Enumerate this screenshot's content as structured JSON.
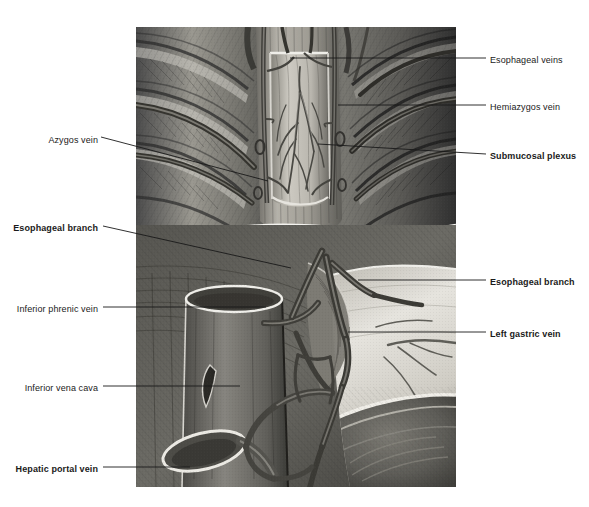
{
  "figure": {
    "kind": "anatomical-illustration",
    "style": "grayscale pencil / wash medical illustration",
    "frame": {
      "x": 136,
      "y": 27,
      "width": 320,
      "height": 460
    }
  },
  "labels": {
    "left": [
      {
        "id": "azygos-vein",
        "text": "Azygos vein",
        "bold": false,
        "text_x": 98,
        "text_y": 141,
        "leader": {
          "x1": 101,
          "y1": 137,
          "x2": 268,
          "y2": 181
        }
      },
      {
        "id": "esophageal-branch-left",
        "text": "Esophageal branch",
        "bold": true,
        "text_x": 98,
        "text_y": 229,
        "leader": {
          "x1": 103,
          "y1": 226,
          "x2": 291,
          "y2": 268
        }
      },
      {
        "id": "inferior-phrenic-vein",
        "text": "Inferior phrenic vein",
        "bold": false,
        "text_x": 98,
        "text_y": 310,
        "leader": {
          "x1": 103,
          "y1": 307,
          "x2": 266,
          "y2": 307
        }
      },
      {
        "id": "inferior-vena-cava",
        "text": "Inferior vena cava",
        "bold": false,
        "text_x": 98,
        "text_y": 389,
        "leader": {
          "x1": 103,
          "y1": 386,
          "x2": 240,
          "y2": 386
        }
      },
      {
        "id": "hepatic-portal-vein",
        "text": "Hepatic portal vein",
        "bold": true,
        "text_x": 98,
        "text_y": 470,
        "leader": {
          "x1": 103,
          "y1": 467,
          "x2": 190,
          "y2": 467
        }
      }
    ],
    "right": [
      {
        "id": "esophageal-veins",
        "text": "Esophageal veins",
        "bold": false,
        "text_x": 490,
        "text_y": 61,
        "leader": {
          "x1": 486,
          "y1": 58,
          "x2": 290,
          "y2": 58
        }
      },
      {
        "id": "hemiazygos-vein",
        "text": "Hemiazygos vein",
        "bold": false,
        "text_x": 490,
        "text_y": 108,
        "leader": {
          "x1": 486,
          "y1": 105,
          "x2": 338,
          "y2": 105
        }
      },
      {
        "id": "submucosal-plexus",
        "text": "Submucosal plexus",
        "bold": true,
        "text_x": 490,
        "text_y": 157,
        "leader": {
          "x1": 486,
          "y1": 154,
          "x2": 318,
          "y2": 144
        }
      },
      {
        "id": "esophageal-branch-right",
        "text": "Esophageal branch",
        "bold": true,
        "text_x": 490,
        "text_y": 283,
        "leader": {
          "x1": 486,
          "y1": 280,
          "x2": 358,
          "y2": 280
        }
      },
      {
        "id": "left-gastric-vein",
        "text": "Left gastric vein",
        "bold": true,
        "text_x": 490,
        "text_y": 335,
        "leader": {
          "x1": 486,
          "y1": 332,
          "x2": 348,
          "y2": 332
        }
      }
    ]
  },
  "colors": {
    "background": "#ffffff",
    "text": "#1a1a1a",
    "leader_line": "#1a1a1a",
    "illustration_mid": "#8c8c8c",
    "illustration_dark": "#3a3a3a",
    "illustration_light": "#d8d6d0",
    "vessel": "#6b6b6b",
    "vessel_highlight": "#e2e0da"
  }
}
